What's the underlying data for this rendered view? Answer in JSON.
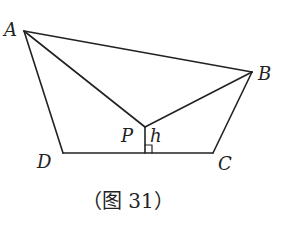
{
  "figure": {
    "caption": "（图 31）",
    "points": {
      "A": {
        "label": "A",
        "x": 24,
        "y": 31
      },
      "B": {
        "label": "B",
        "x": 252,
        "y": 72
      },
      "C": {
        "label": "C",
        "x": 213,
        "y": 153
      },
      "D": {
        "label": "D",
        "x": 63,
        "y": 153
      },
      "P": {
        "label": "P",
        "x": 145,
        "y": 127
      }
    },
    "height_label": "h",
    "segments": [
      "AB",
      "BC",
      "CD",
      "DA",
      "AP",
      "BP",
      "P-foot"
    ],
    "right_angle_marker": true,
    "stroke_color": "#222222"
  }
}
